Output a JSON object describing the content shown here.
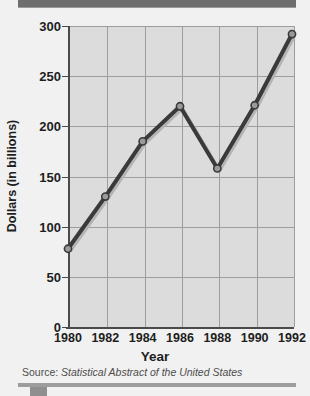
{
  "chart_data": {
    "type": "line",
    "title": "",
    "xlabel": "Year",
    "ylabel": "Dollars (in billions)",
    "categories": [
      "1980",
      "1982",
      "1984",
      "1986",
      "1988",
      "1990",
      "1992"
    ],
    "x": [
      1980,
      1982,
      1984,
      1986,
      1988,
      1990,
      1992
    ],
    "values": [
      78,
      130,
      185,
      220,
      158,
      221,
      292
    ],
    "series": [
      {
        "name": "Dollars (in billions)",
        "values": [
          78,
          130,
          185,
          220,
          158,
          221,
          292
        ]
      }
    ],
    "xlim": [
      1980,
      1992
    ],
    "ylim": [
      0,
      300
    ],
    "y_ticks": [
      0,
      50,
      100,
      150,
      200,
      250,
      300
    ],
    "x_ticks": [
      "1980",
      "1982",
      "1984",
      "1986",
      "1988",
      "1990",
      "1992"
    ],
    "grid": true,
    "legend": "none",
    "marker": "circle",
    "line_color": "#3a3a3a",
    "marker_fill": "#9a9a9a",
    "plot_bg": "#dcdcdc",
    "figure_bg": "#f1f1f1"
  },
  "source": {
    "prefix": "Source:",
    "title": "Statistical Abstract of the United States"
  },
  "decor": {
    "band_top_color": "#6e6e6e",
    "band_bottom_color": "#9d9d9d"
  }
}
